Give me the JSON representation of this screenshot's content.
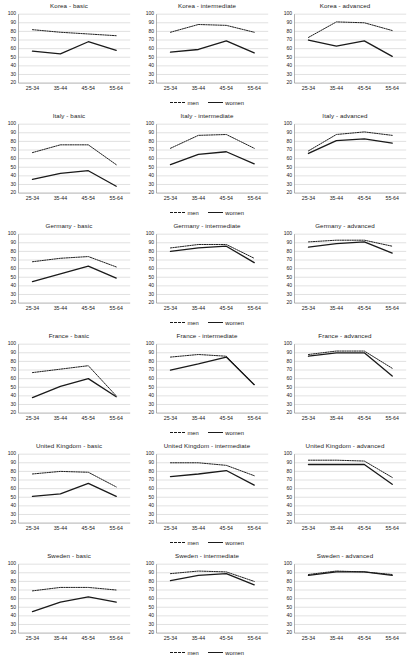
{
  "figure": {
    "x_categories": [
      "25-34",
      "35-44",
      "45-54",
      "55-64"
    ],
    "y_ticks": [
      100,
      90,
      80,
      70,
      60,
      50,
      40,
      30,
      20
    ],
    "ylim": [
      20,
      100
    ],
    "legend": {
      "men_label": "men",
      "women_label": "women"
    },
    "series_colors": {
      "men": "#1a1a1a",
      "women": "#1a1a1a"
    }
  },
  "chart_data": [
    {
      "type": "line",
      "title": "Korea - basic",
      "categories": [
        "25-34",
        "35-44",
        "45-54",
        "55-64"
      ],
      "xlabel": "",
      "ylabel": "",
      "ylim": [
        20,
        100
      ],
      "grid": true,
      "legend_position": "below",
      "series": [
        {
          "name": "men",
          "values": [
            82,
            79,
            77,
            75
          ]
        },
        {
          "name": "women",
          "values": [
            57,
            54,
            68,
            58
          ]
        }
      ]
    },
    {
      "type": "line",
      "title": "Korea - intermediate",
      "categories": [
        "25-34",
        "35-44",
        "45-54",
        "55-64"
      ],
      "xlabel": "",
      "ylabel": "",
      "ylim": [
        20,
        100
      ],
      "grid": true,
      "legend_position": "below",
      "series": [
        {
          "name": "men",
          "values": [
            79,
            88,
            87,
            79
          ]
        },
        {
          "name": "women",
          "values": [
            56,
            59,
            69,
            55
          ]
        }
      ]
    },
    {
      "type": "line",
      "title": "Korea - advanced",
      "categories": [
        "25-34",
        "35-44",
        "45-54",
        "55-64"
      ],
      "xlabel": "",
      "ylabel": "",
      "ylim": [
        20,
        100
      ],
      "grid": true,
      "legend_position": "below",
      "series": [
        {
          "name": "men",
          "values": [
            73,
            91,
            90,
            81
          ]
        },
        {
          "name": "women",
          "values": [
            70,
            63,
            69,
            51
          ]
        }
      ]
    },
    {
      "type": "line",
      "title": "Italy - basic",
      "categories": [
        "25-34",
        "35-44",
        "45-54",
        "55-64"
      ],
      "xlabel": "",
      "ylabel": "",
      "ylim": [
        20,
        100
      ],
      "grid": true,
      "legend_position": "below",
      "series": [
        {
          "name": "men",
          "values": [
            67,
            76,
            76,
            53
          ]
        },
        {
          "name": "women",
          "values": [
            36,
            43,
            46,
            28
          ]
        }
      ]
    },
    {
      "type": "line",
      "title": "Italy - intermediate",
      "categories": [
        "25-34",
        "35-44",
        "45-54",
        "55-64"
      ],
      "xlabel": "",
      "ylabel": "",
      "ylim": [
        20,
        100
      ],
      "grid": true,
      "legend_position": "below",
      "series": [
        {
          "name": "men",
          "values": [
            72,
            87,
            88,
            72
          ]
        },
        {
          "name": "women",
          "values": [
            53,
            65,
            68,
            54
          ]
        }
      ]
    },
    {
      "type": "line",
      "title": "Italy - advanced",
      "categories": [
        "25-34",
        "35-44",
        "45-54",
        "55-64"
      ],
      "xlabel": "",
      "ylabel": "",
      "ylim": [
        20,
        100
      ],
      "grid": true,
      "legend_position": "below",
      "series": [
        {
          "name": "men",
          "values": [
            69,
            88,
            91,
            87
          ]
        },
        {
          "name": "women",
          "values": [
            66,
            81,
            83,
            78
          ]
        }
      ]
    },
    {
      "type": "line",
      "title": "Germany - basic",
      "categories": [
        "25-34",
        "35-44",
        "45-54",
        "55-64"
      ],
      "xlabel": "",
      "ylabel": "",
      "ylim": [
        20,
        100
      ],
      "grid": true,
      "legend_position": "below",
      "series": [
        {
          "name": "men",
          "values": [
            68,
            72,
            74,
            62
          ]
        },
        {
          "name": "women",
          "values": [
            45,
            54,
            63,
            49
          ]
        }
      ]
    },
    {
      "type": "line",
      "title": "Germany - intermediate",
      "categories": [
        "25-34",
        "35-44",
        "45-54",
        "55-64"
      ],
      "xlabel": "",
      "ylabel": "",
      "ylim": [
        20,
        100
      ],
      "grid": true,
      "legend_position": "below",
      "series": [
        {
          "name": "men",
          "values": [
            84,
            88,
            88,
            72
          ]
        },
        {
          "name": "women",
          "values": [
            80,
            84,
            86,
            67
          ]
        }
      ]
    },
    {
      "type": "line",
      "title": "Germany - advanced",
      "categories": [
        "25-34",
        "35-44",
        "45-54",
        "55-64"
      ],
      "xlabel": "",
      "ylabel": "",
      "ylim": [
        20,
        100
      ],
      "grid": true,
      "legend_position": "below",
      "series": [
        {
          "name": "men",
          "values": [
            91,
            93,
            93,
            86
          ]
        },
        {
          "name": "women",
          "values": [
            85,
            89,
            91,
            78
          ]
        }
      ]
    },
    {
      "type": "line",
      "title": "France - basic",
      "categories": [
        "25-34",
        "35-44",
        "45-54",
        "55-64"
      ],
      "xlabel": "",
      "ylabel": "",
      "ylim": [
        20,
        100
      ],
      "grid": true,
      "legend_position": "below",
      "series": [
        {
          "name": "men",
          "values": [
            67,
            71,
            75,
            40
          ]
        },
        {
          "name": "women",
          "values": [
            38,
            51,
            60,
            39
          ]
        }
      ]
    },
    {
      "type": "line",
      "title": "France - intermediate",
      "categories": [
        "25-34",
        "35-44",
        "45-54",
        "55-64"
      ],
      "xlabel": "",
      "ylabel": "",
      "ylim": [
        20,
        100
      ],
      "grid": true,
      "legend_position": "below",
      "series": [
        {
          "name": "men",
          "values": [
            85,
            88,
            86,
            53
          ]
        },
        {
          "name": "women",
          "values": [
            70,
            77,
            85,
            53
          ]
        }
      ]
    },
    {
      "type": "line",
      "title": "France - advanced",
      "categories": [
        "25-34",
        "35-44",
        "45-54",
        "55-64"
      ],
      "xlabel": "",
      "ylabel": "",
      "ylim": [
        20,
        100
      ],
      "grid": true,
      "legend_position": "below",
      "series": [
        {
          "name": "men",
          "values": [
            88,
            92,
            92,
            72
          ]
        },
        {
          "name": "women",
          "values": [
            86,
            90,
            90,
            63
          ]
        }
      ]
    },
    {
      "type": "line",
      "title": "United Kingdom - basic",
      "categories": [
        "25-34",
        "35-44",
        "45-54",
        "55-64"
      ],
      "xlabel": "",
      "ylabel": "",
      "ylim": [
        20,
        100
      ],
      "grid": true,
      "legend_position": "below",
      "series": [
        {
          "name": "men",
          "values": [
            77,
            80,
            79,
            62
          ]
        },
        {
          "name": "women",
          "values": [
            51,
            54,
            66,
            51
          ]
        }
      ]
    },
    {
      "type": "line",
      "title": "United Kingdom - intermediate",
      "categories": [
        "25-34",
        "35-44",
        "45-54",
        "55-64"
      ],
      "xlabel": "",
      "ylabel": "",
      "ylim": [
        20,
        100
      ],
      "grid": true,
      "legend_position": "below",
      "series": [
        {
          "name": "men",
          "values": [
            90,
            90,
            87,
            75
          ]
        },
        {
          "name": "women",
          "values": [
            74,
            77,
            81,
            64
          ]
        }
      ]
    },
    {
      "type": "line",
      "title": "United Kingdom - advanced",
      "categories": [
        "25-34",
        "35-44",
        "45-54",
        "55-64"
      ],
      "xlabel": "",
      "ylabel": "",
      "ylim": [
        20,
        100
      ],
      "grid": true,
      "legend_position": "below",
      "series": [
        {
          "name": "men",
          "values": [
            93,
            93,
            92,
            73
          ]
        },
        {
          "name": "women",
          "values": [
            88,
            88,
            88,
            65
          ]
        }
      ]
    },
    {
      "type": "line",
      "title": "Sweden - basic",
      "categories": [
        "25-34",
        "35-44",
        "45-54",
        "55-64"
      ],
      "xlabel": "",
      "ylabel": "",
      "ylim": [
        20,
        100
      ],
      "grid": true,
      "legend_position": "below",
      "series": [
        {
          "name": "men",
          "values": [
            69,
            73,
            73,
            70
          ]
        },
        {
          "name": "women",
          "values": [
            45,
            56,
            62,
            56
          ]
        }
      ]
    },
    {
      "type": "line",
      "title": "Sweden - intermediate",
      "categories": [
        "25-34",
        "35-44",
        "45-54",
        "55-64"
      ],
      "xlabel": "",
      "ylabel": "",
      "ylim": [
        20,
        100
      ],
      "grid": true,
      "legend_position": "below",
      "series": [
        {
          "name": "men",
          "values": [
            89,
            92,
            91,
            80
          ]
        },
        {
          "name": "women",
          "values": [
            81,
            87,
            89,
            76
          ]
        }
      ]
    },
    {
      "type": "line",
      "title": "Sweden - advanced",
      "categories": [
        "25-34",
        "35-44",
        "45-54",
        "55-64"
      ],
      "xlabel": "",
      "ylabel": "",
      "ylim": [
        20,
        100
      ],
      "grid": true,
      "legend_position": "below",
      "series": [
        {
          "name": "men",
          "values": [
            88,
            92,
            91,
            88
          ]
        },
        {
          "name": "women",
          "values": [
            87,
            91,
            91,
            87
          ]
        }
      ]
    }
  ],
  "legend_visible_panels": [
    1,
    4,
    7,
    10,
    13,
    16
  ]
}
